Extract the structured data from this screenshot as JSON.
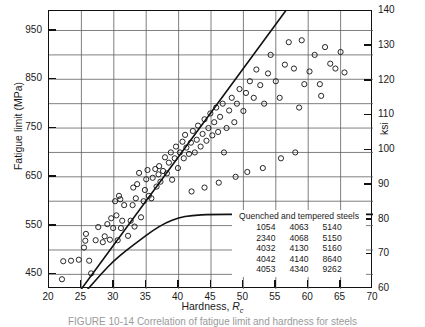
{
  "chart_data": {
    "type": "scatter",
    "title": "",
    "xlabel": "Hardness, Rc",
    "ylabel": "Fatigue limit (MPa)",
    "y2label": "ksi",
    "xlim": [
      20,
      70
    ],
    "ylim": [
      420,
      990
    ],
    "y2lim": [
      60,
      140
    ],
    "grid": true,
    "legend_position": "bottom-right",
    "x_ticks": [
      20,
      25,
      30,
      35,
      40,
      45,
      50,
      55,
      60,
      65,
      70
    ],
    "y_ticks": [
      450,
      550,
      650,
      750,
      850,
      950
    ],
    "y_minor_ticks": [
      500,
      600,
      700,
      800,
      900
    ],
    "y2_ticks": [
      60,
      70,
      80,
      90,
      100,
      110,
      120,
      130,
      140
    ],
    "series": [
      {
        "name": "Quenched and tempered steels",
        "marker": "open-circle",
        "points": [
          [
            22.0,
            440
          ],
          [
            22.2,
            477
          ],
          [
            23.4,
            478
          ],
          [
            24.6,
            480
          ],
          [
            26.2,
            478
          ],
          [
            26.5,
            452
          ],
          [
            25.4,
            505
          ],
          [
            25.6,
            519
          ],
          [
            25.7,
            533
          ],
          [
            27.2,
            520
          ],
          [
            27.6,
            547
          ],
          [
            28.3,
            516
          ],
          [
            28.6,
            528
          ],
          [
            29.0,
            553
          ],
          [
            29.4,
            521
          ],
          [
            29.6,
            565
          ],
          [
            29.9,
            545
          ],
          [
            30.4,
            571
          ],
          [
            30.6,
            520
          ],
          [
            31.1,
            545
          ],
          [
            31.3,
            560
          ],
          [
            31.6,
            592
          ],
          [
            30.2,
            600
          ],
          [
            31.0,
            604
          ],
          [
            30.8,
            611
          ],
          [
            32.2,
            529
          ],
          [
            32.6,
            560
          ],
          [
            32.9,
            592
          ],
          [
            33.2,
            548
          ],
          [
            33.4,
            606
          ],
          [
            33.0,
            628
          ],
          [
            33.6,
            635
          ],
          [
            33.9,
            658
          ],
          [
            34.2,
            567
          ],
          [
            34.6,
            600
          ],
          [
            34.8,
            623
          ],
          [
            35.0,
            645
          ],
          [
            35.4,
            611
          ],
          [
            35.2,
            664
          ],
          [
            35.8,
            606
          ],
          [
            36.0,
            648
          ],
          [
            36.4,
            666
          ],
          [
            36.6,
            630
          ],
          [
            36.9,
            655
          ],
          [
            37.2,
            640
          ],
          [
            37.0,
            672
          ],
          [
            37.6,
            662
          ],
          [
            37.9,
            690
          ],
          [
            38.2,
            657
          ],
          [
            38.5,
            679
          ],
          [
            38.8,
            700
          ],
          [
            39.0,
            644
          ],
          [
            39.4,
            688
          ],
          [
            39.6,
            712
          ],
          [
            39.9,
            668
          ],
          [
            40.2,
            700
          ],
          [
            40.6,
            722
          ],
          [
            40.8,
            688
          ],
          [
            41.2,
            710
          ],
          [
            41.0,
            736
          ],
          [
            41.6,
            697
          ],
          [
            41.9,
            720
          ],
          [
            42.2,
            744
          ],
          [
            42.5,
            700
          ],
          [
            42.8,
            726
          ],
          [
            43.0,
            755
          ],
          [
            43.4,
            712
          ],
          [
            43.7,
            738
          ],
          [
            44.0,
            768
          ],
          [
            44.3,
            724
          ],
          [
            44.6,
            750
          ],
          [
            44.9,
            780
          ],
          [
            45.2,
            735
          ],
          [
            45.5,
            762
          ],
          [
            45.8,
            792
          ],
          [
            46.1,
            742
          ],
          [
            46.4,
            773
          ],
          [
            46.8,
            800
          ],
          [
            47.0,
            700
          ],
          [
            47.4,
            750
          ],
          [
            47.8,
            786
          ],
          [
            48.2,
            812
          ],
          [
            48.6,
            762
          ],
          [
            49.0,
            800
          ],
          [
            49.4,
            830
          ],
          [
            50.0,
            785
          ],
          [
            50.4,
            822
          ],
          [
            51.0,
            846
          ],
          [
            51.6,
            812
          ],
          [
            52.0,
            870
          ],
          [
            52.6,
            838
          ],
          [
            53.2,
            800
          ],
          [
            53.8,
            862
          ],
          [
            54.2,
            900
          ],
          [
            55.0,
            846
          ],
          [
            55.6,
            812
          ],
          [
            56.4,
            880
          ],
          [
            57.0,
            926
          ],
          [
            57.8,
            872
          ],
          [
            58.6,
            792
          ],
          [
            59.4,
            840
          ],
          [
            60.2,
            866
          ],
          [
            61.0,
            900
          ],
          [
            61.8,
            840
          ],
          [
            62.6,
            916
          ],
          [
            63.4,
            882
          ],
          [
            64.2,
            872
          ],
          [
            65.0,
            906
          ],
          [
            65.6,
            864
          ],
          [
            58.0,
            700
          ],
          [
            55.8,
            688
          ],
          [
            53.0,
            668
          ],
          [
            50.6,
            660
          ],
          [
            48.8,
            650
          ],
          [
            46.2,
            638
          ],
          [
            44.0,
            628
          ],
          [
            42.0,
            620
          ],
          [
            62.0,
            816
          ],
          [
            59.0,
            930
          ]
        ]
      }
    ],
    "boundary_lines": [
      {
        "name": "upper-bound-line",
        "type": "straight",
        "points": [
          [
            25,
            420
          ],
          [
            56.5,
            990
          ]
        ]
      },
      {
        "name": "lower-bound-curve",
        "type": "curve",
        "points": [
          [
            26.0,
            420
          ],
          [
            28.0,
            450
          ],
          [
            30.0,
            478
          ],
          [
            32.0,
            500
          ],
          [
            34.0,
            520
          ],
          [
            36.0,
            540
          ],
          [
            38.0,
            556
          ],
          [
            40.0,
            566
          ],
          [
            42.0,
            571
          ],
          [
            45.0,
            573
          ],
          [
            50.0,
            573
          ],
          [
            60.0,
            573
          ],
          [
            70.0,
            573
          ]
        ]
      }
    ],
    "legend": {
      "title": "Quenched and tempered steels",
      "columns": [
        [
          "1054",
          "2340",
          "4032",
          "4042",
          "4053"
        ],
        [
          "4063",
          "4068",
          "4130",
          "4140",
          "4340"
        ],
        [
          "5140",
          "5150",
          "5160",
          "8640",
          "9262"
        ]
      ]
    }
  },
  "axes": {
    "y_left_title": "Fatigue limit (MPa)",
    "y_right_title": "ksi",
    "x_title_main": "Hardness,",
    "x_title_symbol": "R",
    "x_title_sub": "c"
  },
  "figure": {
    "caption": "FIGURE 10-14  Correlation of fatigue limit and hardness for steels"
  }
}
